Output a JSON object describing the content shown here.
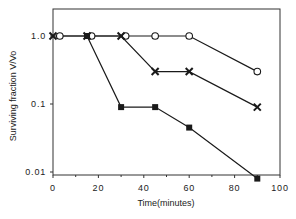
{
  "chart_data": {
    "type": "line",
    "title": "",
    "xlabel": "Time(minutes)",
    "ylabel": "Surviving  fraction  V/Vo",
    "xscale": "linear",
    "yscale": "log",
    "xlim": [
      0,
      100
    ],
    "ylim": [
      0.008,
      2.5
    ],
    "xticks": [
      0,
      20,
      40,
      60,
      80,
      100
    ],
    "xtick_labels": [
      "0",
      "20",
      "40",
      "60",
      "80",
      "100"
    ],
    "yticks": [
      1.0,
      0.1,
      0.01
    ],
    "ytick_labels": [
      "1.0",
      "0.1",
      "0.01"
    ],
    "grid": false,
    "legend": null,
    "series": [
      {
        "name": "open-circle",
        "marker": "open-circle",
        "x": [
          3,
          17,
          32,
          45,
          60,
          90
        ],
        "y": [
          1.0,
          1.0,
          1.0,
          1.0,
          1.0,
          0.3
        ]
      },
      {
        "name": "cross",
        "marker": "x",
        "x": [
          0,
          15,
          30,
          45,
          60,
          90
        ],
        "y": [
          1.0,
          1.0,
          1.0,
          0.3,
          0.3,
          0.09
        ]
      },
      {
        "name": "filled-square",
        "marker": "filled-square",
        "x": [
          15,
          30,
          45,
          60,
          90
        ],
        "y": [
          1.0,
          0.09,
          0.09,
          0.045,
          0.008
        ]
      }
    ]
  },
  "colors": {
    "line": "#1a1a1a",
    "frame": "#333333",
    "background": "#ffffff"
  }
}
